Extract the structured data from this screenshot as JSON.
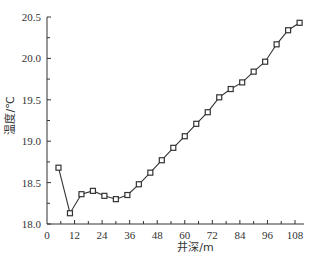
{
  "chart_data": {
    "type": "line",
    "title": "",
    "xlabel": "井深/m",
    "ylabel": "温度/℃",
    "xlim": [
      0,
      112
    ],
    "ylim": [
      18.0,
      20.5
    ],
    "xticks": [
      0,
      12,
      24,
      36,
      48,
      60,
      72,
      84,
      96,
      108
    ],
    "xtick_labels": [
      "0",
      "12",
      "24",
      "36",
      "48",
      "60",
      "72",
      "84",
      "96",
      "108"
    ],
    "x_minor_step": 6,
    "yticks": [
      18.0,
      18.5,
      19.0,
      19.5,
      20.0,
      20.5
    ],
    "ytick_labels": [
      "18.0",
      "18.5",
      "19.0",
      "19.5",
      "20.0",
      "20.5"
    ],
    "y_minor_step": 0.25,
    "grid": false,
    "legend": "none",
    "marker": "square",
    "color": "#333333",
    "series": [
      {
        "name": "温度",
        "x": [
          5,
          10,
          15,
          20,
          25,
          30,
          35,
          40,
          45,
          50,
          55,
          60,
          65,
          70,
          75,
          80,
          85,
          90,
          95,
          100,
          105,
          110
        ],
        "y": [
          18.68,
          18.13,
          18.36,
          18.4,
          18.34,
          18.3,
          18.35,
          18.48,
          18.62,
          18.77,
          18.92,
          19.06,
          19.21,
          19.35,
          19.53,
          19.63,
          19.71,
          19.84,
          19.96,
          20.17,
          20.34,
          20.43
        ]
      }
    ]
  }
}
